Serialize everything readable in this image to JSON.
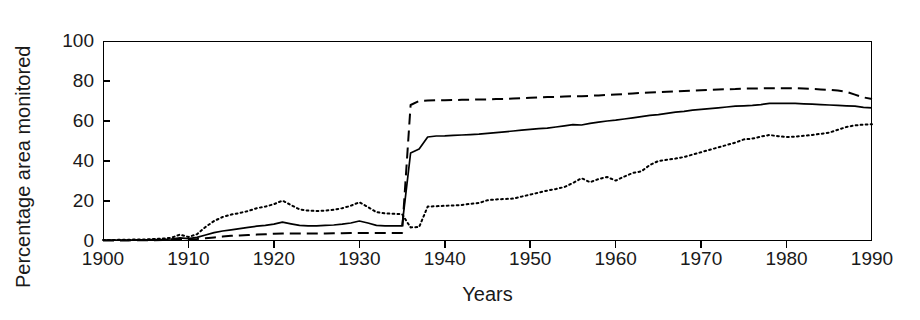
{
  "chart_data": {
    "type": "line",
    "title": "",
    "xlabel": "Years",
    "ylabel": "Percentage area monitored",
    "xlim": [
      1900,
      1990
    ],
    "ylim": [
      0,
      100
    ],
    "xticks": [
      1900,
      1910,
      1920,
      1930,
      1940,
      1950,
      1960,
      1970,
      1980,
      1990
    ],
    "yticks": [
      0,
      20,
      40,
      60,
      80,
      100
    ],
    "grid": false,
    "legend": "none",
    "x": [
      1900,
      1901,
      1902,
      1903,
      1904,
      1905,
      1906,
      1907,
      1908,
      1909,
      1910,
      1911,
      1912,
      1913,
      1914,
      1915,
      1916,
      1917,
      1918,
      1919,
      1920,
      1921,
      1922,
      1923,
      1924,
      1925,
      1926,
      1927,
      1928,
      1929,
      1930,
      1931,
      1932,
      1933,
      1934,
      1935,
      1936,
      1937,
      1938,
      1939,
      1940,
      1941,
      1942,
      1943,
      1944,
      1945,
      1946,
      1947,
      1948,
      1949,
      1950,
      1951,
      1952,
      1953,
      1954,
      1955,
      1956,
      1957,
      1958,
      1959,
      1960,
      1961,
      1962,
      1963,
      1964,
      1965,
      1966,
      1967,
      1968,
      1969,
      1970,
      1971,
      1972,
      1973,
      1974,
      1975,
      1976,
      1977,
      1978,
      1979,
      1980,
      1981,
      1982,
      1983,
      1984,
      1985,
      1986,
      1987,
      1988,
      1989,
      1990
    ],
    "series": [
      {
        "name": "solid-line",
        "style": "solid",
        "color": "#000000",
        "values": [
          0.4,
          0.4,
          0.5,
          0.5,
          0.6,
          0.6,
          0.7,
          0.8,
          1.0,
          1.6,
          1.2,
          1.8,
          3.0,
          4.2,
          5.0,
          5.6,
          6.2,
          6.8,
          7.4,
          7.8,
          8.4,
          9.4,
          8.6,
          7.8,
          7.6,
          7.6,
          7.8,
          8.0,
          8.4,
          9.0,
          10.0,
          9.0,
          7.8,
          7.6,
          7.6,
          7.6,
          44.0,
          46.0,
          52.0,
          52.5,
          52.6,
          52.8,
          53.0,
          53.2,
          53.4,
          53.8,
          54.2,
          54.6,
          55.0,
          55.4,
          55.8,
          56.2,
          56.4,
          57.0,
          57.6,
          58.2,
          58.0,
          58.8,
          59.4,
          60.0,
          60.4,
          61.0,
          61.6,
          62.2,
          62.8,
          63.2,
          63.8,
          64.4,
          64.8,
          65.4,
          65.8,
          66.2,
          66.6,
          67.0,
          67.4,
          67.6,
          67.8,
          68.2,
          68.8,
          68.8,
          68.8,
          68.8,
          68.6,
          68.4,
          68.2,
          68.0,
          67.8,
          67.6,
          67.4,
          66.8,
          66.6
        ]
      },
      {
        "name": "dashed-line",
        "style": "dashed",
        "color": "#000000",
        "values": [
          0.3,
          0.3,
          0.3,
          0.3,
          0.4,
          0.4,
          0.4,
          0.5,
          0.6,
          0.8,
          0.8,
          1.0,
          1.4,
          1.8,
          2.2,
          2.6,
          2.8,
          3.0,
          3.2,
          3.4,
          3.6,
          3.8,
          3.8,
          3.8,
          3.8,
          3.8,
          3.8,
          3.9,
          3.9,
          4.0,
          4.0,
          4.0,
          4.0,
          4.0,
          4.0,
          4.0,
          68.0,
          70.0,
          70.2,
          70.4,
          70.4,
          70.5,
          70.6,
          70.6,
          70.8,
          70.8,
          71.0,
          71.0,
          71.2,
          71.4,
          71.6,
          71.8,
          72.0,
          72.0,
          72.2,
          72.4,
          72.4,
          72.6,
          72.8,
          73.0,
          73.2,
          73.4,
          73.8,
          74.0,
          74.2,
          74.4,
          74.6,
          74.8,
          75.0,
          75.2,
          75.4,
          75.6,
          75.8,
          75.9,
          76.0,
          76.2,
          76.2,
          76.3,
          76.4,
          76.4,
          76.4,
          76.4,
          76.2,
          76.0,
          75.8,
          75.6,
          75.2,
          74.6,
          73.2,
          71.8,
          71.0
        ]
      },
      {
        "name": "dotted-line",
        "style": "dotted",
        "color": "#000000",
        "values": [
          0.5,
          0.5,
          0.6,
          0.6,
          0.8,
          0.8,
          1.0,
          1.2,
          1.6,
          3.2,
          2.0,
          3.4,
          7.0,
          10.0,
          12.0,
          13.2,
          14.0,
          15.0,
          16.4,
          17.2,
          18.4,
          20.2,
          18.0,
          15.8,
          15.2,
          15.0,
          15.2,
          15.6,
          16.4,
          17.6,
          19.4,
          17.0,
          14.4,
          13.8,
          13.6,
          13.4,
          6.8,
          7.0,
          17.2,
          17.4,
          17.6,
          17.8,
          18.0,
          18.6,
          19.0,
          20.4,
          20.8,
          21.0,
          21.2,
          22.2,
          23.2,
          24.2,
          25.2,
          26.0,
          27.0,
          29.0,
          31.4,
          29.4,
          31.0,
          32.0,
          30.2,
          32.2,
          34.0,
          34.8,
          38.0,
          40.0,
          40.6,
          41.2,
          42.0,
          43.2,
          44.4,
          45.6,
          46.8,
          48.0,
          49.2,
          50.8,
          51.2,
          52.2,
          53.0,
          52.4,
          52.0,
          52.2,
          52.6,
          53.0,
          53.6,
          54.2,
          55.6,
          57.0,
          57.8,
          58.2,
          58.4
        ]
      }
    ]
  }
}
